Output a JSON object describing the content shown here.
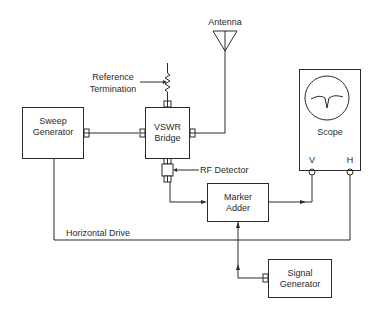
{
  "diagram": {
    "blocks": {
      "sweep_generator": {
        "line1": "Sweep",
        "line2": "Generator"
      },
      "vswr_bridge": {
        "line1": "VSWR",
        "line2": "Bridge"
      },
      "scope": {
        "label": "Scope",
        "v_port": "V",
        "h_port": "H"
      },
      "marker_adder": {
        "line1": "Marker",
        "line2": "Adder"
      },
      "signal_generator": {
        "line1": "Signal",
        "line2": "Generator"
      }
    },
    "labels": {
      "antenna": "Antenna",
      "reference_termination_1": "Reference",
      "reference_termination_2": "Termination",
      "rf_detector": "RF Detector",
      "horizontal_drive": "Horizontal Drive"
    },
    "colors": {
      "line": "#2a2a2a",
      "background": "#ffffff"
    }
  }
}
